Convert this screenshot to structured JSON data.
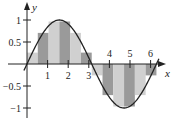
{
  "chart_data": {
    "type": "bar",
    "title": "",
    "function": "sin(x)",
    "interval": [
      0,
      6.2832
    ],
    "n_rectangles": 12,
    "rule": "midpoint",
    "rect_width": 0.5236,
    "rect_heights": [
      0.2588,
      0.7071,
      0.9659,
      0.9659,
      0.7071,
      0.2588,
      -0.2588,
      -0.7071,
      -0.9659,
      -0.9659,
      -0.7071,
      -0.2588
    ],
    "rect_colors": [
      "#d0d0d0",
      "#9a9a9a",
      "#d0d0d0",
      "#9a9a9a",
      "#d0d0d0",
      "#9a9a9a",
      "#d0d0d0",
      "#9a9a9a",
      "#d0d0d0",
      "#9a9a9a",
      "#d0d0d0",
      "#9a9a9a"
    ],
    "xlabel": "x",
    "ylabel": "y",
    "x_ticks": [
      "1",
      "2",
      "3",
      "4",
      "5",
      "6"
    ],
    "x_tick_values": [
      1,
      2,
      3,
      4,
      5,
      6
    ],
    "y_ticks": [
      "1",
      "0.5",
      "−0.5",
      "−1"
    ],
    "y_tick_values": [
      1,
      0.5,
      -0.5,
      -1
    ],
    "xlim": [
      -0.9,
      7.0
    ],
    "ylim": [
      -1.2,
      1.25
    ],
    "grid": false,
    "curve_color": "#222222"
  }
}
